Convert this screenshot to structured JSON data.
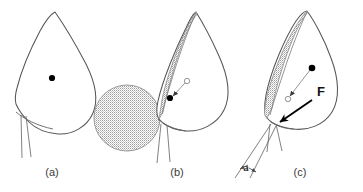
{
  "figure": {
    "title": "",
    "background_color": "#ffffff",
    "outline_color": "#555555",
    "stipple_color": "#b9b9b9",
    "marker_filled_color": "#000000",
    "marker_open_color": "#ffffff",
    "force_arrow_color": "#000000",
    "panels": [
      {
        "id": "a",
        "caption": "(a)",
        "description": "leaf-shaped outline, undeformed",
        "markers": {
          "filled_dot": true,
          "open_dot": false
        },
        "shading": false,
        "sphere": false,
        "force_label": "",
        "angle_label": ""
      },
      {
        "id": "b",
        "caption": "(b)",
        "description": "leaf-shaped outline contacting stippled sphere, shaded crescent on contact side",
        "markers": {
          "filled_dot": true,
          "open_dot": true
        },
        "shading": true,
        "sphere": true,
        "force_label": "",
        "angle_label": ""
      },
      {
        "id": "c",
        "caption": "(c)",
        "description": "leaf-shaped outline deformed, larger shaded crescent, applied force and opening angle",
        "markers": {
          "filled_dot": true,
          "open_dot": true
        },
        "shading": true,
        "sphere": false,
        "force_label": "F",
        "angle_label": "a"
      }
    ],
    "captions": {
      "panel_a": "(a)",
      "panel_b": "(b)",
      "panel_c": "(c)"
    },
    "annotations": {
      "force": "F",
      "angle": "a"
    }
  }
}
